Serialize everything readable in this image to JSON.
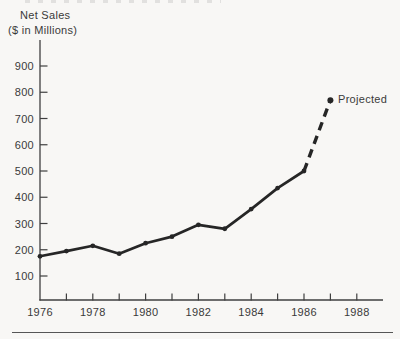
{
  "page": {
    "background": "#f8f7f5",
    "divider_color": "#565656"
  },
  "chart_data": {
    "type": "line",
    "title": "Net Sales ($ in Millions)",
    "title_lines": [
      "Net Sales",
      "($ in Millions)"
    ],
    "xlabel": "",
    "ylabel": "Net Sales ($ in Millions)",
    "ylim": [
      100,
      900
    ],
    "x_range": [
      1976,
      1989
    ],
    "grid": false,
    "legend": "none",
    "y_ticks": [
      100,
      200,
      300,
      400,
      500,
      600,
      700,
      800,
      900
    ],
    "x_ticks": [
      1976,
      1977,
      1978,
      1979,
      1980,
      1981,
      1982,
      1983,
      1984,
      1985,
      1986,
      1987,
      1988
    ],
    "x_label_years": [
      1976,
      1978,
      1980,
      1982,
      1984,
      1986,
      1988
    ],
    "series": [
      {
        "name": "Actual",
        "style": "solid",
        "years": [
          1976,
          1977,
          1978,
          1979,
          1980,
          1981,
          1982,
          1983,
          1984,
          1985,
          1986
        ],
        "values": [
          175,
          195,
          215,
          185,
          225,
          250,
          295,
          280,
          355,
          435,
          500
        ]
      },
      {
        "name": "Projected",
        "style": "dashed",
        "years": [
          1986,
          1987
        ],
        "values": [
          500,
          770
        ]
      }
    ],
    "annotation": {
      "text": "Projected",
      "year": 1987,
      "value": 770
    },
    "colors": {
      "line": "#262626",
      "axis": "#3f3f3f",
      "text": "#3a3a3a"
    }
  }
}
